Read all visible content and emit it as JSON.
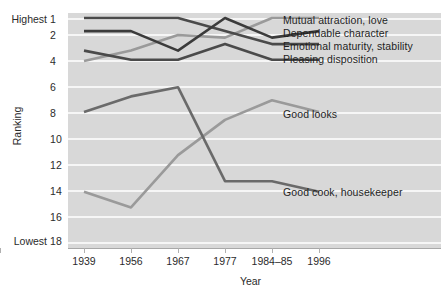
{
  "chart_data": {
    "type": "line",
    "title": "",
    "xlabel": "Year",
    "ylabel": "Ranking",
    "categories": [
      "1939",
      "1956",
      "1967",
      "1977",
      "1984–85",
      "1996"
    ],
    "y_ticks": [
      "1",
      "2",
      "4",
      "6",
      "8",
      "10",
      "12",
      "14",
      "16",
      "18"
    ],
    "y_axis_extremes": {
      "top": "Highest",
      "bottom": "Lowest"
    },
    "ylim": [
      1,
      18
    ],
    "y_inverted": true,
    "grid": true,
    "legend_position": "right-inline-labels",
    "series": [
      {
        "name": "Mutual attraction, love",
        "color": "#9a9a9a",
        "values": [
          4.3,
          3.5,
          2.3,
          2.5,
          1.0,
          1.0
        ],
        "label_x": 283,
        "label_y": 15
      },
      {
        "name": "Dependable character",
        "color": "#4a4a4a",
        "values": [
          1.0,
          1.0,
          1.0,
          2.0,
          3.0,
          3.0
        ],
        "label_x": 283,
        "label_y": 28
      },
      {
        "name": "Emotional maturity, stability",
        "color": "#3b3b3b",
        "values": [
          2.0,
          2.0,
          3.5,
          1.0,
          2.5,
          2.0
        ],
        "label_x": 283,
        "label_y": 41
      },
      {
        "name": "Pleasing disposition",
        "color": "#4a4a4a",
        "values": [
          3.5,
          4.2,
          4.2,
          3.0,
          4.2,
          4.2
        ],
        "label_x": 283,
        "label_y": 54
      },
      {
        "name": "Good looks",
        "color": "#9a9a9a",
        "values": [
          14.3,
          15.5,
          11.5,
          8.8,
          7.3,
          8.2
        ],
        "label_x": 283,
        "label_y": 110
      },
      {
        "name": "Good cook, housekeeper",
        "color": "#6a6a6a",
        "values": [
          8.2,
          7.0,
          6.3,
          13.5,
          13.5,
          14.3
        ],
        "label_x": 283,
        "label_y": 188
      }
    ]
  },
  "axis": {
    "y_title": "Ranking",
    "x_title": "Year",
    "highest_label": "Highest",
    "lowest_label": "Lowest"
  },
  "colors": {
    "panel_background": "#d8d8d8",
    "gridline": "#f6f6f6",
    "text": "#2b2b2b",
    "axis": "#a8a8a8"
  }
}
